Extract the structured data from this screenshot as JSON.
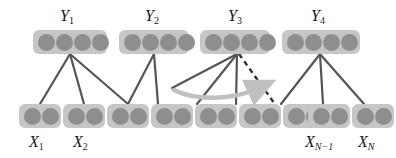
{
  "figure": {
    "type": "graphical-model-diagram",
    "width": 396,
    "height": 158,
    "background_color": "#ffffff",
    "box_color": "#c6c6c6",
    "unit_color": "#8e8e8e",
    "edge_color": "#555555",
    "arrow_color": "#c0c0c0"
  },
  "output_layer": {
    "units_per_node": 4,
    "nodes": [
      {
        "id": "y1",
        "label_base": "Y",
        "label_sub": "1",
        "x": 33,
        "y": 30,
        "width": 74
      },
      {
        "id": "y2",
        "label_base": "Y",
        "label_sub": "2",
        "x": 119,
        "y": 30,
        "width": 70
      },
      {
        "id": "y3",
        "label_base": "Y",
        "label_sub": "3",
        "x": 200,
        "y": 30,
        "width": 70
      },
      {
        "id": "y4",
        "label_base": "Y",
        "label_sub": "4",
        "x": 282,
        "y": 30,
        "width": 78
      }
    ]
  },
  "input_layer": {
    "units_per_node": 2,
    "nodes": [
      {
        "id": "x1",
        "label_base": "X",
        "label_sub": "1",
        "x": 19,
        "y": 104,
        "width": 42,
        "labeled": true
      },
      {
        "id": "x2",
        "label_base": "X",
        "label_sub": "2",
        "x": 63,
        "y": 104,
        "width": 42,
        "labeled": true
      },
      {
        "id": "x3",
        "label_base": "",
        "label_sub": "",
        "x": 107,
        "y": 104,
        "width": 42,
        "labeled": false
      },
      {
        "id": "x4",
        "label_base": "",
        "label_sub": "",
        "x": 151,
        "y": 104,
        "width": 42,
        "labeled": false
      },
      {
        "id": "x5",
        "label_base": "",
        "label_sub": "",
        "x": 195,
        "y": 104,
        "width": 42,
        "labeled": false
      },
      {
        "id": "x6",
        "label_base": "",
        "label_sub": "",
        "x": 225,
        "y": 104,
        "width": 42,
        "labeled": false
      },
      {
        "id": "x7",
        "label_base": "",
        "label_sub": "",
        "x": 269,
        "y": 104,
        "width": 42,
        "labeled": false
      },
      {
        "id": "xn1",
        "label_base": "X",
        "label_sub": "N−1",
        "x": 307,
        "y": 104,
        "width": 42,
        "labeled": true
      },
      {
        "id": "xn",
        "label_base": "X",
        "label_sub": "N",
        "x": 351,
        "y": 104,
        "width": 42,
        "labeled": true
      }
    ]
  },
  "labels": {
    "y1": {
      "base": "Y",
      "sub": "1"
    },
    "y2": {
      "base": "Y",
      "sub": "2"
    },
    "y3": {
      "base": "Y",
      "sub": "3"
    },
    "y4": {
      "base": "Y",
      "sub": "4"
    },
    "x1": {
      "base": "X",
      "sub": "1"
    },
    "x2": {
      "base": "X",
      "sub": "2"
    },
    "xn1": {
      "base": "X",
      "sub": "N−1"
    },
    "xn": {
      "base": "X",
      "sub": "N"
    }
  },
  "edges": {
    "style": "solid",
    "color": "#555555",
    "width": 2.2,
    "connections": [
      {
        "from": "y1",
        "to": "x1"
      },
      {
        "from": "y1",
        "to": "x2"
      },
      {
        "from": "y1",
        "to": "x3"
      },
      {
        "from": "y2",
        "to": "x3"
      },
      {
        "from": "y2",
        "to": "x4"
      },
      {
        "from": "y3",
        "to": "x5"
      },
      {
        "from": "y3",
        "to": "x5b"
      },
      {
        "from": "y3",
        "to": "x6"
      },
      {
        "from": "y4",
        "to": "x7"
      },
      {
        "from": "y4",
        "to": "xn1"
      },
      {
        "from": "y4",
        "to": "xn"
      }
    ]
  },
  "dashed_edge": {
    "style": "dashed",
    "color": "#303030",
    "from": "y3",
    "to": "x7",
    "description": "dashed connection from Y3 down-right to a later input node"
  },
  "curved_arrow": {
    "color": "#c0c0c0",
    "direction": "right",
    "description": "light gray curved arrow sweeping rightward beneath Y3 indicating window shift"
  }
}
